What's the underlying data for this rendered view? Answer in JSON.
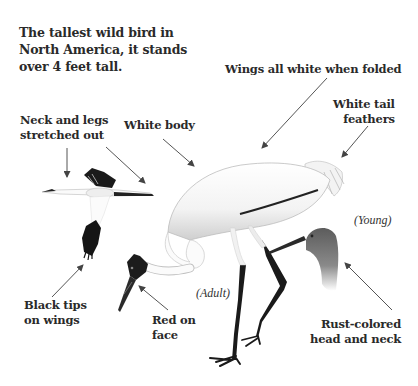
{
  "title": {
    "lines": [
      "The tallest wild bird in",
      "North America, it stands",
      "over 4 feet tall."
    ]
  },
  "callouts": {
    "wings": {
      "lines": [
        "Wings all white when folded"
      ]
    },
    "tail": {
      "lines": [
        "White tail",
        "feathers"
      ]
    },
    "neck_legs": {
      "lines": [
        "Neck and legs",
        "stretched out"
      ]
    },
    "body": {
      "lines": [
        "White body"
      ]
    },
    "wing_tips": {
      "lines": [
        "Black tips",
        "on wings"
      ]
    },
    "face": {
      "lines": [
        "Red on",
        "face"
      ]
    },
    "rust": {
      "lines": [
        "Rust-colored",
        "head and neck"
      ]
    }
  },
  "tags": {
    "adult": "(Adult)",
    "young": "(Young)"
  },
  "colors": {
    "text": "#2a2a2a",
    "arrow": "#555555",
    "black_feather": "#111111",
    "young_head": "#6e6e6e",
    "body_shade": "#e6e6e6"
  }
}
